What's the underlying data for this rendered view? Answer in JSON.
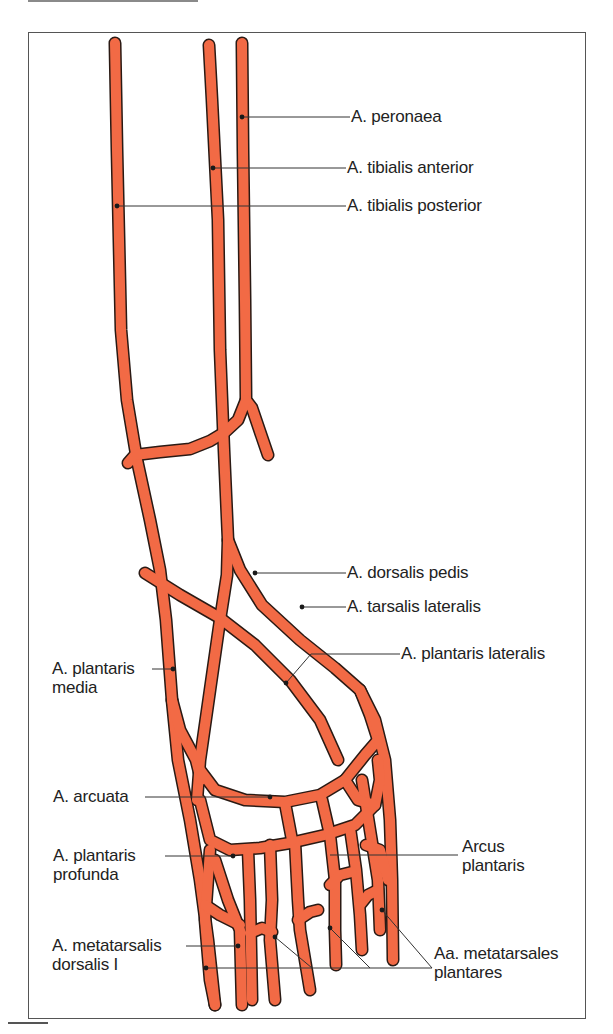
{
  "figure": {
    "vessel_color": "#f26a45",
    "outline_color": "#2a1a14"
  },
  "labels": {
    "peronaea": "A. peronaea",
    "tibialis_anterior": "A. tibialis anterior",
    "tibialis_posterior": "A. tibialis posterior",
    "dorsalis_pedis": "A. dorsalis pedis",
    "tarsalis_lateralis": "A. tarsalis lateralis",
    "plantaris_lateralis": "A. plantaris lateralis",
    "plantaris_media_line1": "A. plantaris",
    "plantaris_media_line2": "media",
    "arcuata": "A. arcuata",
    "plantaris_profunda_line1": "A. plantaris",
    "plantaris_profunda_line2": "profunda",
    "arcus_plantaris_line1": "Arcus",
    "arcus_plantaris_line2": "plantaris",
    "metatarsalis_dorsalis_line1": "A. metatarsalis",
    "metatarsalis_dorsalis_line2": "dorsalis I",
    "metatarsales_plantares_line1": "Aa. metatarsales",
    "metatarsales_plantares_line2": "plantares"
  }
}
